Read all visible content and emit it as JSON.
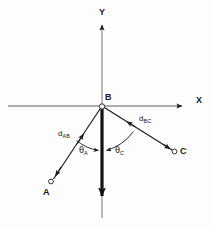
{
  "figure": {
    "background_color": "#fdfdfd",
    "stroke_color": "#1a1a1a",
    "width": 212,
    "height": 228
  },
  "axes": {
    "x_label": "X",
    "y_label": "Y",
    "origin_label": "B",
    "x_axis": {
      "x1": 8,
      "y1": 106,
      "x2": 184,
      "y2": 106
    },
    "y_axis": {
      "x1": 102,
      "y1": 218,
      "x2": 102,
      "y2": 22
    },
    "x_label_pos": {
      "x": 196,
      "y": 101
    },
    "y_label_pos": {
      "x": 99,
      "y": 12
    }
  },
  "points": [
    {
      "id": "A",
      "label": "A",
      "x": 51,
      "y": 182,
      "label_pos": {
        "x": 44,
        "y": 190
      }
    },
    {
      "id": "B",
      "label": "B",
      "x": 102,
      "y": 106,
      "label_pos": {
        "x": 105,
        "y": 96
      }
    },
    {
      "id": "C",
      "label": "C",
      "x": 175,
      "y": 152,
      "label_pos": {
        "x": 181,
        "y": 149
      }
    }
  ],
  "vectors": [
    {
      "id": "BA",
      "from": "B",
      "to": "A",
      "distance_label": "d",
      "distance_subscript": "AB",
      "label_pos": {
        "x": 60,
        "y": 134
      }
    },
    {
      "id": "BC",
      "from": "B",
      "to": "C",
      "distance_label": "d",
      "distance_subscript": "BC",
      "label_pos": {
        "x": 140,
        "y": 119
      }
    },
    {
      "id": "B-down",
      "from": "B",
      "to": "reference-axis",
      "distance_label": "",
      "distance_subscript": ""
    }
  ],
  "angles": [
    {
      "id": "theta_A",
      "symbol": "θ",
      "subscript": "A",
      "between": [
        "BA",
        "B-down"
      ],
      "label_pos": {
        "x": 81,
        "y": 150
      }
    },
    {
      "id": "theta_C",
      "symbol": "θ",
      "subscript": "C",
      "between": [
        "B-down",
        "BC"
      ],
      "label_pos": {
        "x": 117,
        "y": 150
      }
    }
  ]
}
